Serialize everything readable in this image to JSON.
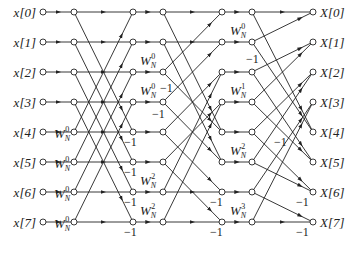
{
  "diagram": {
    "inputs": [
      "x[0]",
      "x[1]",
      "x[2]",
      "x[3]",
      "x[4]",
      "x[5]",
      "x[6]",
      "x[7]"
    ],
    "outputs": [
      "X[0]",
      "X[1]",
      "X[2]",
      "X[3]",
      "X[4]",
      "X[5]",
      "X[6]",
      "X[7]"
    ],
    "rows_y": [
      12,
      42,
      72,
      102,
      132,
      162,
      192,
      222
    ],
    "columns_x": [
      43,
      74,
      133,
      163,
      222,
      252,
      313
    ],
    "twiddle_labels": [
      {
        "base": "W",
        "sub": "N",
        "sup": "0",
        "x": 54,
        "y": 138
      },
      {
        "base": "W",
        "sub": "N",
        "sup": "0",
        "x": 54,
        "y": 168
      },
      {
        "base": "W",
        "sub": "N",
        "sup": "0",
        "x": 54,
        "y": 198
      },
      {
        "base": "W",
        "sub": "N",
        "sup": "0",
        "x": 54,
        "y": 228
      },
      {
        "base": "W",
        "sub": "N",
        "sup": "0",
        "x": 140,
        "y": 65
      },
      {
        "base": "W",
        "sub": "N",
        "sup": "0",
        "x": 140,
        "y": 95
      },
      {
        "base": "W",
        "sub": "N",
        "sup": "2",
        "x": 140,
        "y": 185
      },
      {
        "base": "W",
        "sub": "N",
        "sup": "2",
        "x": 140,
        "y": 215
      },
      {
        "base": "W",
        "sub": "N",
        "sup": "0",
        "x": 230,
        "y": 35
      },
      {
        "base": "W",
        "sub": "N",
        "sup": "1",
        "x": 230,
        "y": 95
      },
      {
        "base": "W",
        "sub": "N",
        "sup": "2",
        "x": 230,
        "y": 155
      },
      {
        "base": "W",
        "sub": "N",
        "sup": "3",
        "x": 230,
        "y": 215
      }
    ],
    "minus_one_labels": [
      {
        "text": "−1",
        "x": 124,
        "y": 146
      },
      {
        "text": "−1",
        "x": 124,
        "y": 176
      },
      {
        "text": "−1",
        "x": 124,
        "y": 206
      },
      {
        "text": "−1",
        "x": 124,
        "y": 236
      },
      {
        "text": "−1",
        "x": 160,
        "y": 92
      },
      {
        "text": "−1",
        "x": 152,
        "y": 118
      },
      {
        "text": "−1",
        "x": 210,
        "y": 206
      },
      {
        "text": "−1",
        "x": 210,
        "y": 236
      },
      {
        "text": "−1",
        "x": 246,
        "y": 63
      },
      {
        "text": "−1",
        "x": 274,
        "y": 146
      },
      {
        "text": "−1",
        "x": 296,
        "y": 206
      },
      {
        "text": "−1",
        "x": 296,
        "y": 236
      }
    ],
    "stages": [
      {
        "from_col": 1,
        "to_col": 2,
        "edges": [
          [
            0,
            0
          ],
          [
            0,
            4
          ],
          [
            1,
            1
          ],
          [
            1,
            5
          ],
          [
            2,
            2
          ],
          [
            2,
            6
          ],
          [
            3,
            3
          ],
          [
            3,
            7
          ],
          [
            4,
            0
          ],
          [
            4,
            4
          ],
          [
            5,
            1
          ],
          [
            5,
            5
          ],
          [
            6,
            2
          ],
          [
            6,
            6
          ],
          [
            7,
            3
          ],
          [
            7,
            7
          ]
        ]
      },
      {
        "from_col": 3,
        "to_col": 4,
        "edges": [
          [
            0,
            0
          ],
          [
            0,
            4
          ],
          [
            1,
            1
          ],
          [
            1,
            5
          ],
          [
            2,
            0
          ],
          [
            2,
            4
          ],
          [
            3,
            1
          ],
          [
            3,
            5
          ],
          [
            4,
            2
          ],
          [
            4,
            6
          ],
          [
            5,
            3
          ],
          [
            5,
            7
          ],
          [
            6,
            2
          ],
          [
            6,
            6
          ],
          [
            7,
            3
          ],
          [
            7,
            7
          ]
        ]
      },
      {
        "from_col": 5,
        "to_col": 6,
        "edges": [
          [
            0,
            0
          ],
          [
            0,
            4
          ],
          [
            1,
            0
          ],
          [
            1,
            4
          ],
          [
            2,
            1
          ],
          [
            2,
            5
          ],
          [
            3,
            1
          ],
          [
            3,
            5
          ],
          [
            4,
            2
          ],
          [
            4,
            6
          ],
          [
            5,
            2
          ],
          [
            5,
            6
          ],
          [
            6,
            3
          ],
          [
            6,
            7
          ],
          [
            7,
            3
          ],
          [
            7,
            7
          ]
        ]
      }
    ]
  }
}
